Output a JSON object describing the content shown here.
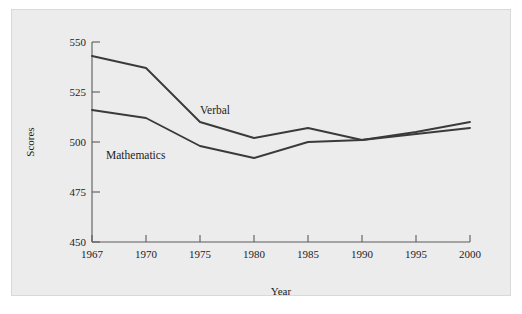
{
  "figure": {
    "background_color": "#ececec",
    "page_color": "#ffffff",
    "line_color": "#3a3a3a",
    "axis_color": "#5b5b5b",
    "text_color": "#1c1c1c"
  },
  "chart_data": {
    "type": "line",
    "title": "",
    "subtitle": "",
    "xlabel": "Year",
    "ylabel": "Scores",
    "categories": [
      "1967",
      "1970",
      "1975",
      "1980",
      "1985",
      "1990",
      "1995",
      "2000"
    ],
    "x": [
      1967,
      1970,
      1975,
      1980,
      1985,
      1990,
      1995,
      2000
    ],
    "xtick_labels": [
      "1967",
      "1970",
      "1975",
      "1980",
      "1985",
      "1990",
      "1995",
      "2000"
    ],
    "ytick_labels": [
      "450",
      "475",
      "500",
      "525",
      "550"
    ],
    "yticks": [
      450,
      475,
      500,
      525,
      550
    ],
    "ylim": [
      450,
      550
    ],
    "xlim_categories": [
      0,
      7
    ],
    "grid": false,
    "legend": "inline-annotations",
    "legend_position": "in-plot",
    "series": [
      {
        "name": "Verbal",
        "label": "Verbal",
        "label_x_category": "1975",
        "label_value": 517,
        "values": [
          543,
          537,
          510,
          502,
          507,
          501,
          505,
          510
        ]
      },
      {
        "name": "Mathematics",
        "label": "Mathematics",
        "label_x_category": "1967",
        "label_value": 498,
        "values": [
          516,
          512,
          498,
          492,
          500,
          501,
          504,
          507
        ]
      }
    ],
    "annotations": [
      {
        "text": "Verbal",
        "x": 200,
        "y": 111
      },
      {
        "text": "Mathematics",
        "x": 110,
        "y": 155
      }
    ]
  },
  "axes": {
    "y_axis_title": "Scores",
    "x_axis_title": "Year"
  }
}
